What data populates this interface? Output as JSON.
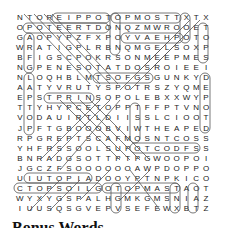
{
  "puzzle": {
    "grid": [
      "NTOREIPPOTOPMOSTTXTX",
      "OPOTEERTDONQZMWROOET",
      "GAOPYPZFXPOYVAEHPOTO",
      "WRATIGPLRBNQMGELSOXP",
      "BFIGSCPOKRSONMEEPMES",
      "NGPENESOTATDOSROIEEI",
      "NLOQHBLMTSOFGSGUNKYD",
      "AATYVRUTYSPOTRSZYQME",
      "EPSTPRINSOPOLEBXXWYP",
      "TTYHYPCETOPPTFFPTVNO",
      "VODAUIRTLDIISSLCIOOT",
      "JPFTGBOOOBVIWTHEAPED",
      "RPGREPTSCAFMOSNTCOSS",
      "YHFRSSOOLSUPOTCODFSS",
      "BNRADGSOTTPTPGWOOPOI",
      "JGCZFSOOOOOOAWPDOPPO",
      "UIUTOPIADOOYPTNPKICO",
      "CTOPSOILGOTOPMASTAOT",
      "WYXYGSPALHGMKGMSNIAZ",
      "IUUSQSGVEPVSEFEWXBTZ"
    ],
    "found_words_visible": [
      "TOPMOST",
      "TOPSOIL",
      "UTOPIA",
      "TOPMAST",
      "YVAEH",
      "SUPOT"
    ],
    "heading": "Bonus Words"
  },
  "colors": {
    "text": "#222222",
    "outline": "#555555",
    "background": "#ffffff"
  }
}
